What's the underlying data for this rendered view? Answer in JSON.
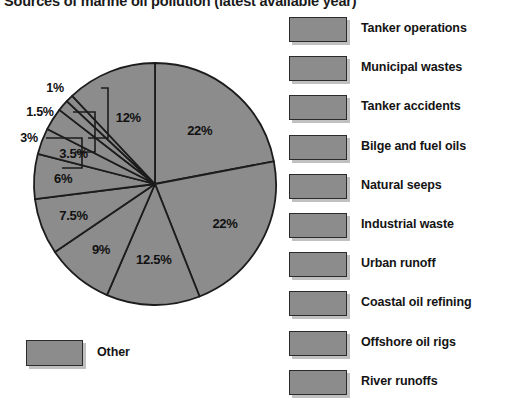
{
  "title": "Sources of marine oil pollution (latest available year)",
  "colors": {
    "slice_fill": "#8c8c8c",
    "slice_stroke": "#1c1c1c",
    "swatch_fill": "#8c8c8c",
    "swatch_stroke": "#2b2b2b",
    "text": "#141414",
    "background": "#ffffff"
  },
  "legend": {
    "items": [
      {
        "label": "Tanker operations"
      },
      {
        "label": "Municipal wastes"
      },
      {
        "label": "Tanker accidents"
      },
      {
        "label": "Bilge and fuel oils"
      },
      {
        "label": "Natural seeps"
      },
      {
        "label": "Industrial waste"
      },
      {
        "label": "Urban runoff"
      },
      {
        "label": "Coastal oil refining"
      },
      {
        "label": "Offshore oil rigs"
      },
      {
        "label": "River runoffs"
      }
    ],
    "other": {
      "label": "Other"
    }
  },
  "chart_data": {
    "type": "pie",
    "title": "Sources of marine oil pollution (latest available year)",
    "xlabel": "",
    "ylabel": "",
    "units": "percent",
    "start_angle_deg": 0,
    "direction": "clockwise",
    "legend_position": "right",
    "grid": false,
    "categories": [
      "Tanker operations",
      "Municipal wastes",
      "Tanker accidents",
      "Bilge and fuel oils",
      "Natural seeps",
      "Industrial waste",
      "Urban runoff",
      "Coastal oil refining",
      "Offshore oil rigs",
      "River runoffs",
      "Other"
    ],
    "values": [
      22,
      22,
      12.5,
      9,
      7.5,
      6,
      3.5,
      3,
      1.5,
      1,
      12
    ],
    "labels": [
      "22%",
      "22%",
      "12.5%",
      "9%",
      "7.5%",
      "6%",
      "3.5%",
      "3%",
      "1.5%",
      "1%",
      "12%"
    ],
    "slices": [
      {
        "category": "Tanker operations",
        "value": 22,
        "label": "22%",
        "label_placement": "inside"
      },
      {
        "category": "Municipal wastes",
        "value": 22,
        "label": "22%",
        "label_placement": "inside"
      },
      {
        "category": "Tanker accidents",
        "value": 12.5,
        "label": "12.5%",
        "label_placement": "inside"
      },
      {
        "category": "Bilge and fuel oils",
        "value": 9,
        "label": "9%",
        "label_placement": "inside"
      },
      {
        "category": "Natural seeps",
        "value": 7.5,
        "label": "7.5%",
        "label_placement": "inside"
      },
      {
        "category": "Industrial waste",
        "value": 6,
        "label": "6%",
        "label_placement": "inside"
      },
      {
        "category": "Urban runoff",
        "value": 3.5,
        "label": "3.5%",
        "label_placement": "inside"
      },
      {
        "category": "Coastal oil refining",
        "value": 3,
        "label": "3%",
        "label_placement": "outside-leader"
      },
      {
        "category": "Offshore oil rigs",
        "value": 1.5,
        "label": "1.5%",
        "label_placement": "outside-leader"
      },
      {
        "category": "River runoffs",
        "value": 1,
        "label": "1%",
        "label_placement": "outside-leader"
      },
      {
        "category": "Other",
        "value": 12,
        "label": "12%",
        "label_placement": "inside"
      }
    ]
  }
}
